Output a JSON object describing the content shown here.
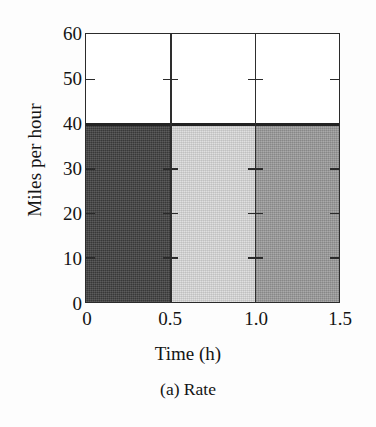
{
  "chart_data": {
    "type": "bar",
    "title": "",
    "subtitle": "(a) Rate",
    "xlabel": "Time (h)",
    "ylabel": "Miles per hour",
    "xlim": [
      0,
      1.5
    ],
    "ylim": [
      0,
      60
    ],
    "grid": false,
    "legend": "none",
    "x_ticks": [
      "0",
      "0.5",
      "1.0",
      "1.5"
    ],
    "x_tick_values": [
      0,
      0.5,
      1.0,
      1.5
    ],
    "y_ticks": [
      "0",
      "10",
      "20",
      "30",
      "40",
      "50",
      "60"
    ],
    "y_tick_values": [
      0,
      10,
      20,
      30,
      40,
      50,
      60
    ],
    "categories": [
      "0-0.5",
      "0.5-1.0",
      "1.0-1.5"
    ],
    "values": [
      40,
      40,
      40
    ],
    "bars": [
      {
        "label": "0-0.5",
        "x_start": 0,
        "x_end": 0.5,
        "value": 40,
        "color": "#3f3f3f"
      },
      {
        "label": "0.5-1.0",
        "x_start": 0.5,
        "x_end": 1.0,
        "value": 40,
        "color": "#dadada"
      },
      {
        "label": "1.0-1.5",
        "x_start": 1.0,
        "x_end": 1.5,
        "value": 40,
        "color": "#9a9a9a"
      }
    ]
  },
  "figure": {
    "ylabel": "Miles per hour",
    "xlabel": "Time (h)",
    "subcaption": "(a) Rate",
    "y_tick_labels": [
      "60",
      "50",
      "40",
      "30",
      "20",
      "10",
      "0"
    ],
    "x_tick_labels": [
      "0",
      "0.5",
      "1.0",
      "1.5"
    ]
  },
  "colors": {
    "axis": "#2b2b2b",
    "text": "#141414",
    "background": "#fdfdfd",
    "bar_1": "#3f3f3f",
    "bar_2": "#dadada",
    "bar_3": "#9a9a9a"
  }
}
